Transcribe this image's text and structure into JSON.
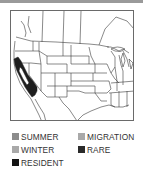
{
  "map": {
    "region": "Western and central North America (United States, southern Canada, northern Mexico)",
    "range_highlight": "Resident range along California coast and Central Valley",
    "range_color": "#1e1e1e",
    "line_color": "#333333"
  },
  "legend": {
    "items": [
      {
        "label": "SUMMER",
        "color": "#8c8c8c"
      },
      {
        "label": "MIGRATION",
        "color": "#a9a9a9"
      },
      {
        "label": "WINTER",
        "color": "#a9a9a9"
      },
      {
        "label": "RARE",
        "color": "#2a2a2a"
      },
      {
        "label": "RESIDENT",
        "color": "#141414"
      }
    ]
  }
}
